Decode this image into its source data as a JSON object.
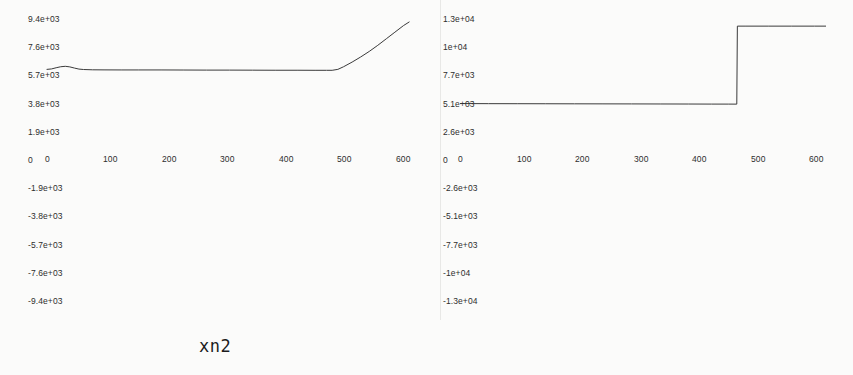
{
  "page": {
    "background": "#fbfbfa",
    "ink": "#2e2e2e",
    "width": 853,
    "height": 375
  },
  "chart_data": [
    {
      "type": "line",
      "title": "xn2",
      "xlabel": "",
      "ylabel": "",
      "grid": false,
      "legend": null,
      "xlim": [
        0,
        640
      ],
      "ylim": [
        -9400,
        9400
      ],
      "xticks": [
        0,
        100,
        200,
        300,
        400,
        500,
        600
      ],
      "xticklabels": [
        "0",
        "100",
        "200",
        "300",
        "400",
        "500",
        "600"
      ],
      "yticks": [
        9400,
        7600,
        5700,
        3800,
        1900,
        0,
        -1900,
        -3800,
        -5700,
        -7600,
        -9400
      ],
      "yticklabels": [
        "9.4e+03",
        "7.6e+03",
        "5.7e+03",
        "3.8e+03",
        "1.9e+03",
        "0",
        "-1.9e+03",
        "-3.8e+03",
        "-5.7e+03",
        "-7.6e+03",
        "-9.4e+03"
      ],
      "series": [
        {
          "name": "xn2",
          "x": [
            0,
            8,
            16,
            24,
            32,
            40,
            48,
            56,
            64,
            80,
            100,
            130,
            160,
            200,
            240,
            280,
            320,
            360,
            400,
            440,
            470,
            490,
            500,
            510,
            520,
            535,
            550,
            565,
            580,
            595,
            610,
            625,
            635
          ],
          "y": [
            6150,
            6180,
            6260,
            6330,
            6360,
            6320,
            6240,
            6170,
            6140,
            6120,
            6115,
            6110,
            6110,
            6110,
            6105,
            6100,
            6100,
            6095,
            6090,
            6090,
            6085,
            6085,
            6085,
            6150,
            6330,
            6650,
            7000,
            7380,
            7800,
            8250,
            8700,
            9150,
            9400
          ]
        }
      ]
    },
    {
      "type": "line",
      "title": "xn2cs",
      "xlabel": "",
      "ylabel": "",
      "grid": false,
      "legend": null,
      "xlim": [
        0,
        640
      ],
      "ylim": [
        -13000,
        13000
      ],
      "xticks": [
        0,
        100,
        200,
        300,
        400,
        500,
        600
      ],
      "xticklabels": [
        "0",
        "100",
        "200",
        "300",
        "400",
        "500",
        "600"
      ],
      "yticks": [
        13000,
        10000,
        7700,
        5100,
        2600,
        0,
        -2600,
        -5100,
        -7700,
        -10000,
        -13000
      ],
      "yticklabels": [
        "1.3e+04",
        "1e+04",
        "7.7e+03",
        "5.1e+03",
        "2.6e+03",
        "0",
        "-2.6e+03",
        "-5.1e+03",
        "-7.7e+03",
        "-1e+04",
        "-1.3e+04"
      ],
      "series": [
        {
          "name": "xn2cs",
          "x": [
            0,
            50,
            100,
            150,
            200,
            250,
            300,
            350,
            400,
            440,
            470,
            484,
            485,
            500,
            540,
            580,
            620,
            640
          ],
          "y": [
            5300,
            5290,
            5285,
            5280,
            5275,
            5270,
            5265,
            5260,
            5255,
            5250,
            5248,
            5245,
            12700,
            12700,
            12700,
            12700,
            12700,
            12700
          ]
        }
      ]
    }
  ],
  "captions": {
    "left": "xn2",
    "right": "xn2cs"
  }
}
